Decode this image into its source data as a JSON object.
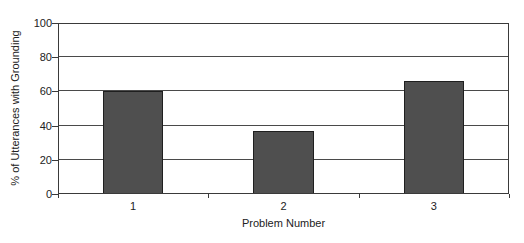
{
  "chart_data": {
    "type": "bar",
    "categories": [
      "1",
      "2",
      "3"
    ],
    "values": [
      60,
      37,
      66
    ],
    "xlabel": "Problem Number",
    "ylabel": "% of Utterances with Grounding",
    "ylim": [
      0,
      100
    ],
    "yticks": [
      0,
      20,
      40,
      60,
      80,
      100
    ],
    "grid": "horizontal",
    "legend": "none",
    "bar_width_frac": 0.4,
    "colors": {
      "bar_fill": "#4f4f4f",
      "bar_border": "#1f1f1f",
      "gridline": "#4a4a4a",
      "frame": "#3a3a3a",
      "text": "#222222",
      "background": "#ffffff"
    }
  }
}
